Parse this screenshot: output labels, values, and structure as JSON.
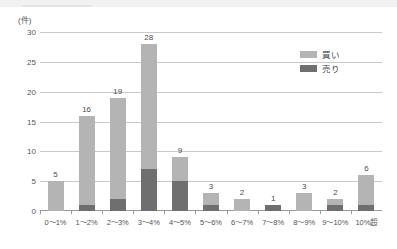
{
  "chart_data": {
    "type": "bar",
    "subtype": "stacked-column",
    "title": "",
    "xlabel": "",
    "ylabel": "",
    "unit_label": "(件)",
    "ylim": [
      0,
      30
    ],
    "yticks": [
      0,
      5,
      10,
      15,
      20,
      25,
      30
    ],
    "grid": true,
    "legend_position": "top-right",
    "categories": [
      "0〜1%",
      "1〜2%",
      "2〜3%",
      "3〜4%",
      "4〜5%",
      "5〜6%",
      "6〜7%",
      "7〜8%",
      "8〜9%",
      "9〜10%",
      "10%超"
    ],
    "series": [
      {
        "name": "売り",
        "color": "#6f6f6f",
        "values": [
          0,
          1,
          2,
          7,
          5,
          1,
          0,
          1,
          0,
          1,
          1
        ]
      },
      {
        "name": "買い",
        "color": "#b4b4b4",
        "values": [
          5,
          15,
          17,
          21,
          4,
          2,
          2,
          0,
          3,
          1,
          5
        ]
      }
    ],
    "totals": [
      5,
      16,
      19,
      28,
      9,
      3,
      2,
      1,
      3,
      2,
      6
    ],
    "total_labels": [
      "5",
      "16",
      "19",
      "28",
      "9",
      "3",
      "2",
      "1",
      "3",
      "2",
      "6"
    ],
    "ytick_labels": [
      "0",
      "5",
      "10",
      "15",
      "20",
      "25",
      "30"
    ]
  },
  "legend": {
    "items": [
      {
        "label": "買い",
        "color": "#b4b4b4"
      },
      {
        "label": "売り",
        "color": "#6f6f6f"
      }
    ]
  }
}
